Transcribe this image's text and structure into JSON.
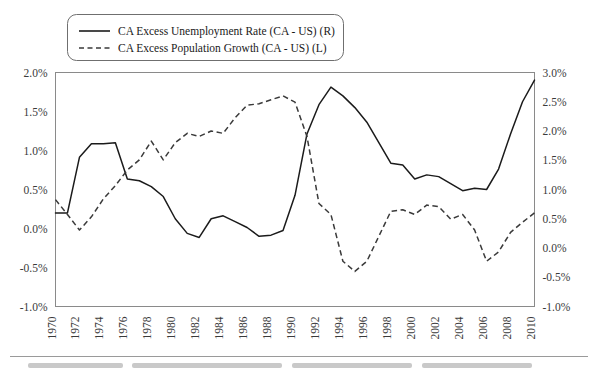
{
  "chart_data": {
    "type": "line",
    "title": "",
    "xlabel": "",
    "ylabel_left": "",
    "ylabel_right": "",
    "grid": false,
    "legend_position": "top-left",
    "x": [
      1970,
      1971,
      1972,
      1973,
      1974,
      1975,
      1976,
      1977,
      1978,
      1979,
      1980,
      1981,
      1982,
      1983,
      1984,
      1985,
      1986,
      1987,
      1988,
      1989,
      1990,
      1991,
      1992,
      1993,
      1994,
      1995,
      1996,
      1997,
      1998,
      1999,
      2000,
      2001,
      2002,
      2003,
      2004,
      2005,
      2006,
      2007,
      2008,
      2009,
      2010
    ],
    "x_tick_labels": [
      "1970",
      "1972",
      "1974",
      "1976",
      "1978",
      "1980",
      "1982",
      "1984",
      "1986",
      "1988",
      "1990",
      "1992",
      "1994",
      "1996",
      "1998",
      "2000",
      "2002",
      "2004",
      "2006",
      "2008",
      "2010"
    ],
    "left_axis": {
      "label": "CA Excess Population Growth (CA - US) (L)",
      "ylim": [
        -1.0,
        2.0
      ],
      "ticks": [
        "-1.0%",
        "-0.5%",
        "0.0%",
        "0.5%",
        "1.0%",
        "1.5%",
        "2.0%"
      ],
      "tick_values": [
        -1.0,
        -0.5,
        0.0,
        0.5,
        1.0,
        1.5,
        2.0
      ]
    },
    "right_axis": {
      "label": "CA Excess Unemployment Rate (CA - US) (R)",
      "ylim": [
        -1.0,
        3.0
      ],
      "ticks": [
        "-1.0%",
        "-0.5%",
        "0.0%",
        "0.5%",
        "1.0%",
        "1.5%",
        "2.0%",
        "2.5%",
        "3.0%"
      ],
      "tick_values": [
        -1.0,
        -0.5,
        0.0,
        0.5,
        1.0,
        1.5,
        2.0,
        2.5,
        3.0
      ]
    },
    "series": [
      {
        "name": "CA Excess Unemployment Rate (CA - US) (R)",
        "axis": "right",
        "style": "solid",
        "color": "#1b1b1b",
        "values": [
          0.6,
          0.6,
          1.55,
          1.78,
          1.78,
          1.8,
          1.18,
          1.15,
          1.05,
          0.88,
          0.5,
          0.25,
          0.18,
          0.5,
          0.55,
          0.45,
          0.35,
          0.2,
          0.22,
          0.3,
          0.9,
          1.95,
          2.45,
          2.75,
          2.6,
          2.4,
          2.15,
          1.8,
          1.45,
          1.42,
          1.18,
          1.25,
          1.22,
          1.1,
          0.98,
          1.02,
          1.0,
          1.35,
          1.95,
          2.5,
          2.87
        ]
      },
      {
        "name": "CA Excess Population Growth (CA - US) (L)",
        "axis": "left",
        "style": "dashed",
        "color": "#3a3a3a",
        "values": [
          0.37,
          0.18,
          -0.02,
          0.15,
          0.38,
          0.55,
          0.75,
          0.88,
          1.12,
          0.88,
          1.1,
          1.22,
          1.18,
          1.25,
          1.22,
          1.42,
          1.58,
          1.6,
          1.65,
          1.7,
          1.62,
          1.18,
          0.32,
          0.18,
          -0.42,
          -0.55,
          -0.42,
          -0.1,
          0.22,
          0.24,
          0.18,
          0.3,
          0.28,
          0.12,
          0.18,
          -0.02,
          -0.42,
          -0.3,
          -0.05,
          0.08,
          0.2
        ]
      }
    ]
  },
  "legend": {
    "entries": [
      {
        "label": "CA Excess Unemployment Rate (CA - US) (R)",
        "style": "solid"
      },
      {
        "label": "CA Excess Population Growth (CA - US) (L)",
        "style": "dashed"
      }
    ]
  }
}
